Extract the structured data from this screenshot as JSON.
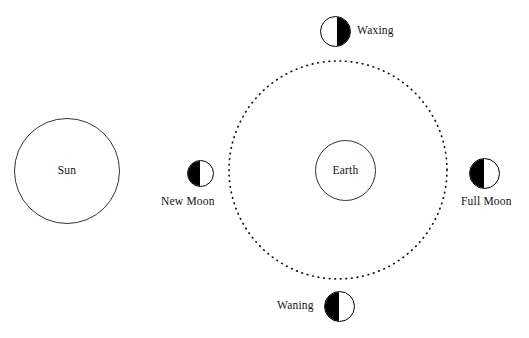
{
  "diagram": {
    "type": "moon-phases-orbit-diagram",
    "background_color": "#ffffff",
    "stroke_color": "#161616",
    "fill_color": "#000000",
    "bodies": {
      "sun": {
        "label": "Sun",
        "shape": "circle",
        "fill": "white",
        "outline": "#333333"
      },
      "earth": {
        "label": "Earth",
        "shape": "circle",
        "fill": "white",
        "outline": "#333333"
      }
    },
    "orbit": {
      "name": "moon-orbit",
      "style": "dotted",
      "shape": "circle"
    },
    "moon_phases": [
      {
        "id": "waxing",
        "label": "Waxing",
        "position": "top",
        "lit_side": "right",
        "dark_side": "left",
        "label_side": "right"
      },
      {
        "id": "new-moon",
        "label": "New Moon",
        "position": "left",
        "lit_side": "left",
        "dark_side": "right",
        "label_side": "below"
      },
      {
        "id": "full-moon",
        "label": "Full Moon",
        "position": "right",
        "lit_side": "left",
        "dark_side": "right",
        "label_side": "below"
      },
      {
        "id": "waning",
        "label": "Waning",
        "position": "bottom",
        "lit_side": "left",
        "dark_side": "right",
        "label_side": "left"
      }
    ]
  }
}
